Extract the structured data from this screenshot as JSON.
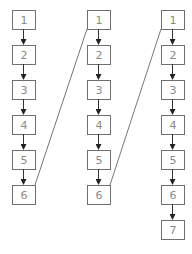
{
  "diagram": {
    "type": "linked-list-columns",
    "columns": [
      {
        "id": "col1",
        "nodes": [
          "1",
          "2",
          "3",
          "4",
          "5",
          "6"
        ]
      },
      {
        "id": "col2",
        "nodes": [
          "1",
          "2",
          "3",
          "4",
          "5",
          "6"
        ]
      },
      {
        "id": "col3",
        "nodes": [
          "1",
          "2",
          "3",
          "4",
          "5",
          "6",
          "7"
        ]
      }
    ],
    "cross_links": [
      {
        "from": "col1.6",
        "to": "col2.1"
      },
      {
        "from": "col2.6",
        "to": "col3.1"
      }
    ],
    "colors": {
      "box_stroke": "#6f6f6f",
      "label": "#8a8a8a",
      "arrow": "#333333"
    }
  }
}
